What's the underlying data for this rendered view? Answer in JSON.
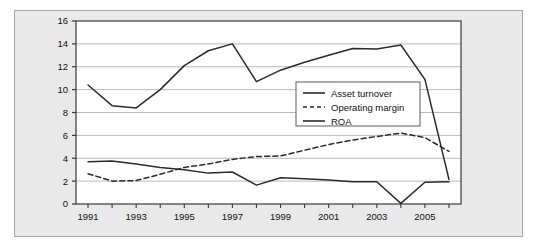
{
  "chart_data": {
    "type": "line",
    "title": "",
    "xlabel": "",
    "ylabel": "",
    "grid": true,
    "legend_position": "center-right",
    "x": [
      1991,
      1992,
      1993,
      1994,
      1995,
      1996,
      1997,
      1998,
      1999,
      2000,
      2001,
      2002,
      2003,
      2004,
      2005,
      2006
    ],
    "xtick_labels": [
      "1991",
      "1993",
      "1995",
      "1997",
      "1999",
      "2001",
      "2003",
      "2005"
    ],
    "xtick_values": [
      1991,
      1993,
      1995,
      1997,
      1999,
      2001,
      2003,
      2005
    ],
    "xlim": [
      1990.5,
      2006.5
    ],
    "ytick_labels": [
      "0",
      "2",
      "4",
      "6",
      "8",
      "10",
      "12",
      "14",
      "16"
    ],
    "ytick_values": [
      0,
      2,
      4,
      6,
      8,
      10,
      12,
      14,
      16
    ],
    "ylim": [
      0,
      16
    ],
    "series": [
      {
        "name": "Asset turnover",
        "style": "solid",
        "color": "#2b2b2b",
        "values": [
          3.7,
          3.75,
          3.5,
          3.2,
          3.0,
          2.7,
          2.8,
          1.65,
          2.3,
          2.2,
          2.1,
          1.95,
          1.95,
          0.05,
          1.9,
          1.95
        ]
      },
      {
        "name": "Operating margin",
        "style": "dashed",
        "color": "#2b2b2b",
        "values": [
          2.65,
          2.0,
          2.05,
          2.6,
          3.2,
          3.5,
          3.9,
          4.15,
          4.2,
          4.7,
          5.2,
          5.6,
          5.9,
          6.2,
          5.8,
          4.6
        ]
      },
      {
        "name": "ROA",
        "style": "solid",
        "color": "#2b2b2b",
        "values": [
          10.4,
          8.6,
          8.4,
          10.0,
          12.1,
          13.4,
          14.0,
          10.7,
          11.7,
          12.4,
          13.0,
          13.6,
          13.55,
          13.9,
          10.9,
          2.15
        ]
      }
    ],
    "legend_entries": [
      "Asset turnover",
      "Operating margin",
      "ROA"
    ]
  },
  "colors": {
    "figure_background": "#e9e9e9",
    "plot_background": "#ffffff",
    "gridline": "#b9b9b9",
    "axis": "#3a3a3a",
    "text": "#111111",
    "outer_border": "#a8a8a8"
  }
}
